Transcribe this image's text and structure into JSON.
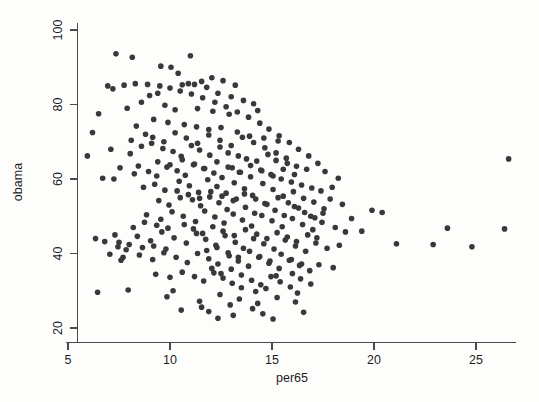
{
  "chart_data": {
    "type": "scatter",
    "title": "",
    "xlabel": "per65",
    "ylabel": "obama",
    "xlim": [
      4.3,
      27.3
    ],
    "ylim": [
      18.0,
      102.0
    ],
    "xticks": [
      5,
      10,
      15,
      20,
      25
    ],
    "yticks": [
      20,
      40,
      60,
      80,
      100
    ],
    "xticklabels": [
      "5",
      "10",
      "15",
      "20",
      "25"
    ],
    "yticklabels": [
      "20",
      "40",
      "60",
      "80",
      "100"
    ],
    "grid": false,
    "legend": null,
    "marker": {
      "shape": "circle",
      "color": "#393939",
      "size": 5.6
    },
    "n_points": 340,
    "points": [
      [
        7.35,
        93.6
      ],
      [
        6.95,
        85.0
      ],
      [
        8.15,
        92.7
      ],
      [
        9.55,
        90.3
      ],
      [
        10.05,
        90.0
      ],
      [
        10.4,
        88.4
      ],
      [
        11.0,
        93.1
      ],
      [
        12.05,
        87.2
      ],
      [
        12.6,
        86.4
      ],
      [
        13.2,
        85.2
      ],
      [
        6.5,
        77.5
      ],
      [
        7.9,
        79.0
      ],
      [
        9.0,
        82.4
      ],
      [
        9.4,
        83.0
      ],
      [
        10.6,
        85.3
      ],
      [
        10.9,
        85.6
      ],
      [
        11.2,
        85.4
      ],
      [
        11.55,
        86.2
      ],
      [
        11.8,
        84.6
      ],
      [
        12.35,
        83.0
      ],
      [
        13.0,
        82.1
      ],
      [
        13.6,
        81.1
      ],
      [
        14.1,
        80.2
      ],
      [
        8.6,
        80.6
      ],
      [
        9.75,
        79.8
      ],
      [
        10.25,
        78.6
      ],
      [
        11.35,
        78.9
      ],
      [
        12.1,
        78.2
      ],
      [
        12.9,
        77.4
      ],
      [
        14.3,
        78.4
      ],
      [
        6.2,
        72.5
      ],
      [
        7.1,
        68.0
      ],
      [
        5.95,
        66.2
      ],
      [
        8.35,
        74.2
      ],
      [
        8.8,
        72.0
      ],
      [
        9.2,
        76.0
      ],
      [
        9.9,
        75.2
      ],
      [
        10.7,
        74.6
      ],
      [
        11.3,
        74.0
      ],
      [
        11.9,
        73.3
      ],
      [
        12.5,
        73.8
      ],
      [
        13.3,
        72.6
      ],
      [
        13.9,
        71.5
      ],
      [
        14.6,
        71.0
      ],
      [
        15.3,
        70.2
      ],
      [
        7.55,
        63.0
      ],
      [
        8.05,
        66.8
      ],
      [
        8.45,
        63.5
      ],
      [
        9.1,
        69.6
      ],
      [
        9.65,
        68.2
      ],
      [
        10.15,
        67.4
      ],
      [
        10.55,
        66.1
      ],
      [
        11.05,
        69.0
      ],
      [
        11.45,
        67.8
      ],
      [
        11.95,
        66.4
      ],
      [
        12.45,
        68.6
      ],
      [
        12.85,
        67.0
      ],
      [
        13.35,
        66.2
      ],
      [
        13.75,
        65.4
      ],
      [
        14.25,
        64.8
      ],
      [
        14.8,
        66.6
      ],
      [
        15.2,
        65.0
      ],
      [
        15.75,
        64.2
      ],
      [
        16.2,
        63.4
      ],
      [
        16.7,
        62.6
      ],
      [
        6.7,
        60.2
      ],
      [
        7.25,
        60.0
      ],
      [
        8.25,
        61.4
      ],
      [
        8.95,
        62.0
      ],
      [
        9.35,
        60.8
      ],
      [
        9.85,
        63.2
      ],
      [
        10.35,
        62.2
      ],
      [
        10.75,
        61.0
      ],
      [
        11.15,
        63.8
      ],
      [
        11.65,
        62.8
      ],
      [
        12.15,
        61.6
      ],
      [
        12.55,
        60.4
      ],
      [
        13.05,
        63.0
      ],
      [
        13.45,
        61.8
      ],
      [
        13.95,
        60.6
      ],
      [
        14.45,
        62.4
      ],
      [
        14.95,
        61.2
      ],
      [
        15.45,
        60.0
      ],
      [
        15.95,
        59.2
      ],
      [
        16.45,
        58.4
      ],
      [
        16.95,
        57.6
      ],
      [
        17.4,
        56.8
      ],
      [
        8.7,
        57.8
      ],
      [
        9.25,
        58.6
      ],
      [
        9.75,
        57.0
      ],
      [
        10.45,
        59.4
      ],
      [
        10.95,
        58.2
      ],
      [
        11.4,
        56.4
      ],
      [
        11.85,
        59.8
      ],
      [
        12.3,
        58.0
      ],
      [
        12.75,
        56.2
      ],
      [
        13.15,
        59.0
      ],
      [
        13.65,
        57.4
      ],
      [
        14.05,
        55.6
      ],
      [
        14.55,
        58.8
      ],
      [
        15.05,
        57.2
      ],
      [
        15.55,
        55.4
      ],
      [
        16.05,
        56.6
      ],
      [
        16.55,
        54.8
      ],
      [
        17.05,
        53.8
      ],
      [
        9.45,
        54.2
      ],
      [
        9.95,
        53.0
      ],
      [
        10.5,
        55.0
      ],
      [
        11.1,
        54.4
      ],
      [
        11.5,
        52.8
      ],
      [
        11.95,
        55.2
      ],
      [
        12.4,
        53.6
      ],
      [
        12.8,
        51.8
      ],
      [
        13.25,
        54.6
      ],
      [
        13.7,
        52.4
      ],
      [
        14.15,
        50.8
      ],
      [
        14.65,
        53.4
      ],
      [
        15.15,
        51.6
      ],
      [
        15.6,
        50.2
      ],
      [
        16.1,
        52.6
      ],
      [
        16.6,
        51.0
      ],
      [
        17.1,
        49.6
      ],
      [
        17.55,
        52.0
      ],
      [
        19.9,
        51.6
      ],
      [
        20.4,
        51.0
      ],
      [
        8.85,
        50.4
      ],
      [
        9.55,
        49.2
      ],
      [
        10.1,
        51.2
      ],
      [
        10.65,
        50.0
      ],
      [
        11.25,
        48.6
      ],
      [
        11.7,
        51.4
      ],
      [
        12.2,
        49.8
      ],
      [
        12.65,
        48.2
      ],
      [
        13.1,
        50.6
      ],
      [
        13.55,
        49.0
      ],
      [
        14.0,
        47.4
      ],
      [
        14.5,
        50.2
      ],
      [
        15.0,
        48.8
      ],
      [
        15.5,
        47.2
      ],
      [
        16.0,
        49.4
      ],
      [
        16.5,
        47.8
      ],
      [
        17.0,
        46.4
      ],
      [
        17.45,
        48.4
      ],
      [
        18.1,
        47.0
      ],
      [
        18.6,
        45.8
      ],
      [
        6.35,
        44.0
      ],
      [
        6.8,
        43.2
      ],
      [
        7.45,
        41.8
      ],
      [
        7.85,
        41.0
      ],
      [
        8.4,
        44.6
      ],
      [
        9.05,
        43.4
      ],
      [
        9.6,
        45.8
      ],
      [
        10.2,
        44.2
      ],
      [
        10.8,
        42.8
      ],
      [
        11.3,
        45.4
      ],
      [
        11.75,
        43.8
      ],
      [
        12.25,
        42.2
      ],
      [
        12.7,
        44.8
      ],
      [
        13.2,
        43.0
      ],
      [
        13.6,
        41.4
      ],
      [
        14.1,
        44.0
      ],
      [
        14.6,
        42.6
      ],
      [
        15.1,
        41.2
      ],
      [
        15.65,
        43.6
      ],
      [
        16.15,
        42.0
      ],
      [
        16.65,
        40.6
      ],
      [
        17.15,
        42.8
      ],
      [
        17.7,
        41.4
      ],
      [
        18.3,
        42.2
      ],
      [
        22.9,
        42.4
      ],
      [
        7.6,
        38.2
      ],
      [
        7.7,
        39.0
      ],
      [
        8.5,
        39.6
      ],
      [
        9.15,
        38.4
      ],
      [
        9.7,
        40.2
      ],
      [
        10.3,
        39.0
      ],
      [
        10.85,
        37.6
      ],
      [
        11.35,
        40.0
      ],
      [
        11.9,
        38.6
      ],
      [
        12.35,
        37.2
      ],
      [
        12.9,
        39.4
      ],
      [
        13.35,
        38.0
      ],
      [
        13.85,
        36.6
      ],
      [
        14.35,
        39.0
      ],
      [
        14.85,
        37.4
      ],
      [
        15.35,
        36.0
      ],
      [
        15.85,
        38.2
      ],
      [
        16.35,
        36.8
      ],
      [
        16.85,
        35.4
      ],
      [
        17.3,
        37.0
      ],
      [
        18.0,
        36.2
      ],
      [
        9.3,
        34.4
      ],
      [
        10.0,
        33.6
      ],
      [
        10.6,
        35.0
      ],
      [
        11.2,
        33.8
      ],
      [
        11.65,
        32.6
      ],
      [
        12.15,
        34.8
      ],
      [
        12.6,
        33.4
      ],
      [
        13.05,
        32.0
      ],
      [
        13.5,
        34.2
      ],
      [
        14.0,
        32.8
      ],
      [
        14.45,
        31.6
      ],
      [
        14.95,
        33.8
      ],
      [
        15.4,
        32.4
      ],
      [
        15.9,
        31.0
      ],
      [
        16.4,
        33.2
      ],
      [
        16.9,
        31.8
      ],
      [
        6.45,
        29.6
      ],
      [
        7.95,
        30.2
      ],
      [
        9.85,
        28.4
      ],
      [
        11.45,
        27.2
      ],
      [
        12.45,
        29.0
      ],
      [
        13.4,
        27.8
      ],
      [
        14.3,
        26.6
      ],
      [
        15.25,
        28.2
      ],
      [
        16.25,
        29.4
      ],
      [
        10.55,
        24.8
      ],
      [
        12.35,
        22.6
      ],
      [
        13.1,
        23.4
      ],
      [
        15.05,
        22.4
      ],
      [
        11.55,
        25.6
      ],
      [
        14.05,
        25.2
      ],
      [
        16.55,
        24.2
      ],
      [
        26.6,
        65.4
      ],
      [
        26.4,
        46.6
      ],
      [
        24.8,
        41.8
      ],
      [
        23.6,
        46.8
      ],
      [
        21.1,
        42.6
      ],
      [
        19.4,
        46.0
      ],
      [
        18.9,
        49.4
      ],
      [
        18.45,
        53.2
      ],
      [
        17.85,
        54.6
      ],
      [
        17.95,
        57.8
      ],
      [
        18.25,
        60.2
      ],
      [
        17.6,
        62.0
      ],
      [
        17.25,
        64.2
      ],
      [
        16.8,
        66.2
      ],
      [
        16.3,
        68.0
      ],
      [
        15.85,
        69.8
      ],
      [
        15.35,
        71.6
      ],
      [
        14.85,
        73.4
      ],
      [
        14.4,
        75.0
      ],
      [
        13.85,
        76.6
      ],
      [
        13.3,
        78.0
      ],
      [
        12.75,
        79.4
      ],
      [
        12.2,
        80.6
      ],
      [
        11.6,
        81.8
      ],
      [
        11.05,
        82.8
      ],
      [
        10.5,
        83.6
      ],
      [
        10.0,
        84.4
      ],
      [
        9.5,
        85.0
      ],
      [
        8.9,
        85.4
      ],
      [
        8.3,
        85.6
      ],
      [
        7.75,
        85.2
      ],
      [
        7.2,
        84.2
      ],
      [
        8.1,
        70.4
      ],
      [
        8.6,
        68.8
      ],
      [
        9.15,
        71.2
      ],
      [
        9.7,
        70.0
      ],
      [
        10.25,
        72.4
      ],
      [
        10.8,
        71.0
      ],
      [
        11.35,
        69.6
      ],
      [
        11.9,
        71.8
      ],
      [
        12.45,
        70.4
      ],
      [
        13.0,
        69.0
      ],
      [
        13.55,
        71.2
      ],
      [
        14.1,
        69.8
      ],
      [
        14.65,
        68.4
      ],
      [
        15.2,
        67.0
      ],
      [
        15.7,
        65.6
      ],
      [
        9.4,
        64.6
      ],
      [
        10.0,
        63.8
      ],
      [
        10.6,
        65.2
      ],
      [
        11.2,
        64.0
      ],
      [
        11.7,
        62.8
      ],
      [
        12.3,
        64.6
      ],
      [
        12.85,
        63.2
      ],
      [
        13.4,
        61.8
      ],
      [
        13.95,
        63.6
      ],
      [
        14.5,
        62.2
      ],
      [
        15.05,
        60.8
      ],
      [
        15.55,
        62.6
      ],
      [
        16.1,
        61.2
      ],
      [
        10.35,
        56.8
      ],
      [
        10.9,
        55.8
      ],
      [
        11.45,
        54.8
      ],
      [
        12.0,
        56.6
      ],
      [
        12.55,
        55.4
      ],
      [
        13.1,
        54.2
      ],
      [
        13.65,
        56.0
      ],
      [
        14.2,
        54.6
      ],
      [
        14.75,
        53.2
      ],
      [
        15.3,
        55.0
      ],
      [
        15.8,
        53.6
      ],
      [
        16.3,
        52.2
      ],
      [
        10.7,
        47.8
      ],
      [
        11.15,
        46.6
      ],
      [
        11.6,
        45.4
      ],
      [
        12.1,
        47.2
      ],
      [
        12.6,
        46.0
      ],
      [
        13.15,
        44.8
      ],
      [
        13.7,
        46.4
      ],
      [
        14.25,
        45.2
      ],
      [
        14.75,
        44.0
      ],
      [
        15.25,
        45.6
      ],
      [
        15.75,
        44.4
      ],
      [
        16.2,
        43.2
      ],
      [
        11.8,
        40.8
      ],
      [
        12.3,
        41.6
      ],
      [
        12.85,
        40.2
      ],
      [
        13.35,
        39.0
      ],
      [
        13.9,
        40.6
      ],
      [
        14.4,
        39.2
      ],
      [
        14.9,
        38.0
      ],
      [
        15.45,
        39.8
      ],
      [
        15.95,
        38.4
      ],
      [
        16.45,
        37.2
      ],
      [
        12.05,
        36.0
      ],
      [
        12.5,
        34.6
      ],
      [
        13.0,
        35.8
      ],
      [
        13.5,
        30.8
      ],
      [
        14.2,
        29.8
      ],
      [
        14.7,
        30.6
      ],
      [
        15.2,
        34.0
      ],
      [
        16.0,
        34.6
      ],
      [
        9.9,
        46.8
      ],
      [
        9.35,
        47.6
      ],
      [
        8.75,
        48.4
      ],
      [
        8.2,
        47.0
      ],
      [
        7.3,
        45.0
      ],
      [
        16.75,
        45.0
      ],
      [
        17.2,
        44.2
      ],
      [
        16.9,
        50.0
      ],
      [
        17.5,
        50.8
      ],
      [
        7.05,
        39.8
      ],
      [
        7.5,
        43.0
      ],
      [
        8.0,
        42.4
      ],
      [
        8.65,
        41.6
      ],
      [
        9.2,
        42.0
      ],
      [
        9.8,
        41.2
      ],
      [
        12.95,
        26.2
      ],
      [
        11.9,
        24.4
      ],
      [
        14.55,
        23.8
      ],
      [
        10.15,
        30.0
      ],
      [
        16.15,
        27.0
      ]
    ]
  },
  "axes": {
    "x_title": "per65",
    "y_title": "obama"
  }
}
